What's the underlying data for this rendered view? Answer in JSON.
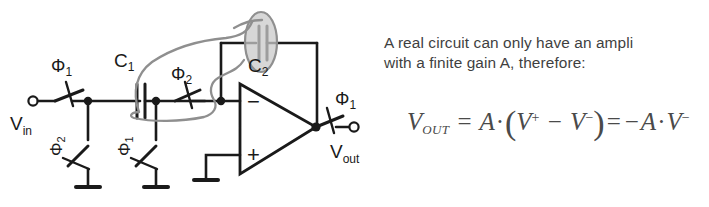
{
  "slide": {
    "background": "#ffffff",
    "ink_color": "#1a1a1a",
    "annotation_color": "#8f8f8f",
    "annotation_fill": "#c9c9c9",
    "text_color": "#3f3f3f"
  },
  "text": {
    "line1": "A real circuit can only have an ampli",
    "line2_pre": "with a finite gain ",
    "line2_bold": "A",
    "line2_post": ", therefore:"
  },
  "formula": {
    "lhs": "V",
    "lhs_sub": "OUT",
    "eq1": "=",
    "gain": "A",
    "dot1": "·",
    "open": "(",
    "vplus": "V",
    "vplus_sup": "+",
    "minus": "−",
    "vminus": "V",
    "vminus_sup": "−",
    "close": ")",
    "eq2": "=",
    "neg": "−",
    "gain2": "A",
    "dot2": "·",
    "vminus2": "V",
    "vminus2_sup": "−",
    "plain": "V_OUT = A·(V⁺ − V⁻) = −A·V⁻"
  },
  "circuit": {
    "title": "switched-capacitor inverting amplifier",
    "input_terminal_label": "V",
    "input_terminal_sub": "in",
    "output_terminal_label": "V",
    "output_terminal_sub": "out",
    "phi1": "Φ",
    "phi1_sub": "1",
    "phi2": "Φ",
    "phi2_sub": "2",
    "cap1": "C",
    "cap1_sub": "1",
    "cap2": "C",
    "cap2_sub": "2",
    "opamp_minus": "−",
    "opamp_plus": "+",
    "labels": {
      "switch_in_phase": "Φ1",
      "switch_shunt1_phase": "Φ2",
      "switch_shunt2_phase": "Φ1",
      "switch_series2_phase": "Φ2",
      "switch_out_phase": "Φ1"
    }
  },
  "annotation": {
    "name": "hand-drawn-highlight",
    "description": "gray lasso around C1 branch linking up to shaded ellipse over C2"
  }
}
